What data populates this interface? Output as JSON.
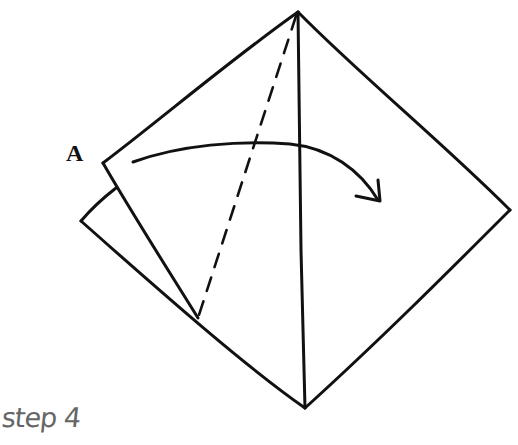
{
  "diagram": {
    "type": "origami-fold-step",
    "point_label": "A",
    "caption": "step 4",
    "stroke_color": "#111111",
    "caption_color": "#666666",
    "elements": {
      "outline": "diamond-shaped folded paper",
      "fold_line": "dashed valley fold from top apex to lower-left edge",
      "center_crease": "solid vertical line from top apex to bottom apex",
      "back_flap": "layer visible behind corner A",
      "arrow": "curved arrow showing corner A folding to the right"
    }
  }
}
